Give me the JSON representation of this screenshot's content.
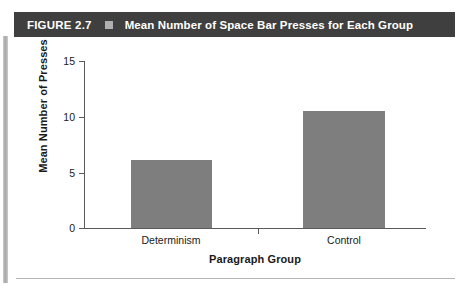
{
  "header": {
    "figure_number": "FIGURE 2.7",
    "separator_icon": "square-bullet-icon",
    "title": "Mean Number of Space Bar Presses for Each Group",
    "background_color": "#3f3f3f",
    "text_color": "#ffffff"
  },
  "chart_data": {
    "type": "bar",
    "title": "Mean Number of Space Bar Presses for Each Group",
    "categories": [
      "Determinism",
      "Control"
    ],
    "values": [
      6.1,
      10.5
    ],
    "xlabel": "Paragraph Group",
    "ylabel": "Mean Number of Presses",
    "ylim": [
      0,
      15
    ],
    "yticks": [
      0,
      5,
      10,
      15
    ],
    "ytick_labels": [
      "0",
      "5",
      "10",
      "15"
    ],
    "grid": false,
    "legend": false,
    "bar_color": "#7e7e7e",
    "axis_color": "#5a5a5a"
  }
}
